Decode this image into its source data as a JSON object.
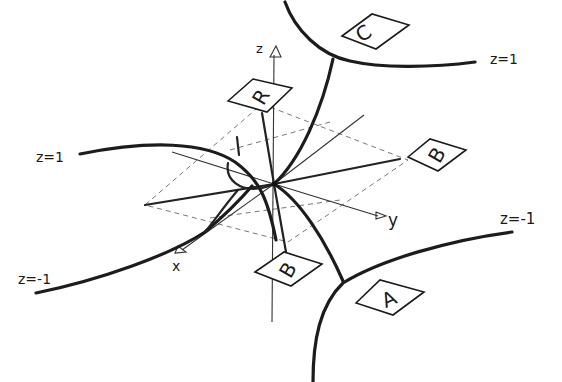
{
  "diagram": {
    "type": "3d-sketch",
    "axes": {
      "z": "z",
      "y": "y",
      "x": "x"
    },
    "curve_labels": {
      "top_left": "z=1",
      "top_right": "z=1",
      "bottom_left": "z=-1",
      "bottom_right": "z=-1"
    },
    "point_labels": {
      "C": "C",
      "R": "R",
      "B_right": "B",
      "B_bottom": "B",
      "A": "A"
    },
    "colors": {
      "ink": "#1c1c1c",
      "guide": "#777777",
      "background": "#ffffff"
    }
  }
}
